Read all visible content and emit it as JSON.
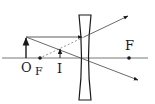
{
  "diagram": {
    "labels": {
      "object": "O",
      "focus_left": "F",
      "image": "I",
      "focus_right": "F"
    },
    "colors": {
      "background": "#ffffff",
      "stroke": "#1a1a1a",
      "ray": "#444444"
    },
    "elements": {
      "principal_axis": {
        "x1": 2,
        "x2": 148,
        "y": 58
      },
      "lens": {
        "type": "concave",
        "center_x": 85,
        "top": 15,
        "bottom": 100
      },
      "object_arrow": {
        "x": 26,
        "y_base": 58,
        "y_tip": 37
      },
      "image_arrow": {
        "x": 60,
        "y_base": 58,
        "y_tip": 49
      },
      "focal_points": [
        {
          "x": 40,
          "y": 58
        },
        {
          "x": 129,
          "y": 58
        }
      ]
    }
  }
}
